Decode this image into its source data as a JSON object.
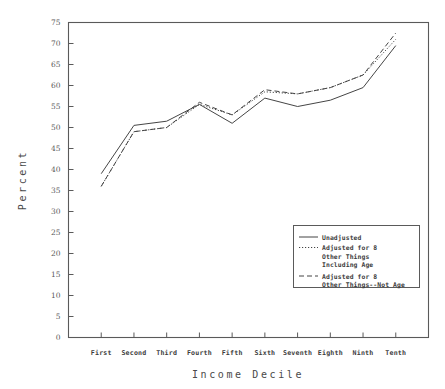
{
  "chart_data": {
    "type": "line",
    "title": "",
    "xlabel": "Income Decile",
    "ylabel": "Percent",
    "categories": [
      "First",
      "Second",
      "Third",
      "Fourth",
      "Fifth",
      "Sixth",
      "Seventh",
      "Eighth",
      "Ninth",
      "Tenth"
    ],
    "ylim": [
      0,
      75
    ],
    "yticks": [
      0,
      5,
      10,
      15,
      20,
      25,
      30,
      35,
      40,
      45,
      50,
      55,
      60,
      65,
      70,
      75
    ],
    "ytick_labels": [
      "0",
      "5",
      "10",
      "15",
      "20",
      "25",
      "30",
      "35",
      "40",
      "45",
      "50",
      "55",
      "60",
      "65",
      "70",
      "75"
    ],
    "grid": false,
    "legend_position": "lower right",
    "series": [
      {
        "name": "Unadjusted",
        "style": "solid",
        "color": "#454545",
        "values": [
          39,
          50.5,
          51.5,
          55.5,
          51,
          57,
          55,
          56.5,
          59.5,
          69.5
        ]
      },
      {
        "name": "Adjusted for 8 Other Things Including Age",
        "style": "dotted",
        "color": "#454545",
        "values": [
          36,
          49,
          50,
          55.5,
          53,
          58.5,
          58,
          59.5,
          62.5,
          71
        ]
      },
      {
        "name": "Adjusted for 8 Other Things--Not Age",
        "style": "dashed",
        "color": "#454545",
        "values": [
          36,
          49,
          50,
          56,
          53,
          59,
          58,
          59.5,
          62.5,
          72.5
        ]
      }
    ]
  },
  "legend": {
    "entries": [
      {
        "line1": "Unadjusted",
        "line2": "",
        "line3": ""
      },
      {
        "line1": "Adjusted for 8",
        "line2": "Other Things",
        "line3": "Including Age"
      },
      {
        "line1": "Adjusted for 8",
        "line2": "Other Things--Not Age",
        "line3": ""
      }
    ]
  }
}
